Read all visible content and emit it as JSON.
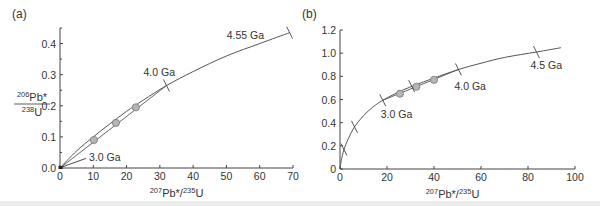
{
  "chart_data": [
    {
      "type": "line",
      "panel_label": "(a)",
      "title": "",
      "xlabel": "²⁰⁷Pb*/²³⁵U",
      "ylabel_num": "²⁰⁶Pb*",
      "ylabel_den": "²³⁸U",
      "xlim": [
        0,
        70
      ],
      "ylim": [
        0,
        0.45
      ],
      "xticks": [
        0,
        10,
        20,
        30,
        40,
        50,
        60,
        70
      ],
      "xtick_labels": [
        "0",
        "10",
        "20",
        "30",
        "40",
        "50",
        "60",
        "70"
      ],
      "yticks": [
        0.0,
        0.1,
        0.2,
        0.3,
        0.4
      ],
      "ytick_labels": [
        "0.0",
        "0.1",
        "0.2",
        "0.3",
        "0.4"
      ],
      "grid": false,
      "series": [
        {
          "name": "concordia",
          "x": [
            0,
            5,
            10,
            15,
            20,
            25,
            32,
            40,
            50,
            60,
            69
          ],
          "y": [
            0,
            0.055,
            0.1,
            0.142,
            0.182,
            0.218,
            0.265,
            0.31,
            0.36,
            0.4,
            0.435
          ]
        },
        {
          "name": "discordia",
          "x": [
            0,
            32
          ],
          "y": [
            0,
            0.265
          ]
        },
        {
          "name": "samples",
          "kind": "scatter",
          "x": [
            10.2,
            16.8,
            22.8
          ],
          "y": [
            0.09,
            0.145,
            0.195
          ]
        }
      ],
      "annotations": [
        {
          "text": "4.55 Ga",
          "x": 69,
          "y": 0.435
        },
        {
          "text": "4.0 Ga",
          "x": 32,
          "y": 0.265
        },
        {
          "text": "3.0 Ga",
          "x": 0.3,
          "y": 0.002
        }
      ]
    },
    {
      "type": "line",
      "panel_label": "(b)",
      "title": "",
      "xlabel": "²⁰⁷Pb*/²³⁵U",
      "ylabel": "",
      "xlim": [
        0,
        100
      ],
      "ylim": [
        0,
        1.2
      ],
      "xticks": [
        0,
        20,
        40,
        60,
        80,
        100
      ],
      "xtick_labels": [
        "0",
        "20",
        "40",
        "60",
        "80",
        "100"
      ],
      "yticks": [
        0,
        0.2,
        0.4,
        0.6,
        0.8,
        1.0,
        1.2
      ],
      "ytick_labels": [
        "0",
        "0.2",
        "0.4",
        "0.6",
        "0.8",
        "1.0",
        "1.2"
      ],
      "grid": false,
      "series": [
        {
          "name": "concordia",
          "x": [
            0,
            0.5,
            1.68,
            3.5,
            6.17,
            10,
            14,
            18.2,
            25,
            31.4,
            40,
            50.4,
            60,
            70,
            83.6,
            94
          ],
          "y": [
            0,
            0.07,
            0.168,
            0.26,
            0.364,
            0.46,
            0.535,
            0.593,
            0.665,
            0.72,
            0.785,
            0.859,
            0.913,
            0.963,
            1.01,
            1.047
          ]
        },
        {
          "name": "discordia",
          "x": [
            18.2,
            50.4
          ],
          "y": [
            0.593,
            0.859
          ]
        },
        {
          "name": "samples",
          "kind": "scatter",
          "x": [
            25.5,
            32.5,
            40
          ],
          "y": [
            0.65,
            0.71,
            0.77
          ]
        }
      ],
      "tick_marks_on_curve": [
        {
          "x": 1.68,
          "y": 0.168
        },
        {
          "x": 6.17,
          "y": 0.364
        },
        {
          "x": 18.2,
          "y": 0.593
        },
        {
          "x": 30.5,
          "y": 0.715
        },
        {
          "x": 50.4,
          "y": 0.859
        },
        {
          "x": 83.6,
          "y": 1.01
        }
      ],
      "annotations": [
        {
          "text": "3.0 Ga",
          "x": 18.2,
          "y": 0.593
        },
        {
          "text": "4.0 Ga",
          "x": 50.4,
          "y": 0.859
        },
        {
          "text": "4.5 Ga",
          "x": 83.6,
          "y": 1.01
        }
      ]
    }
  ]
}
